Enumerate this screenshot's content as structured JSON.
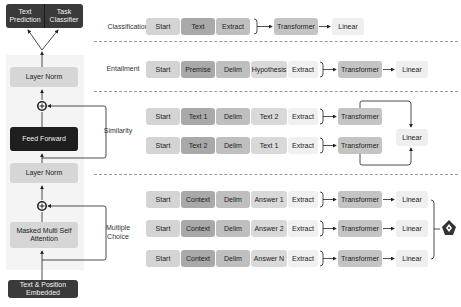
{
  "model": {
    "output_heads": [
      {
        "id": "text-prediction",
        "label": "Text Prediction"
      },
      {
        "id": "task-classifier",
        "label": "Task Classifier"
      }
    ],
    "layer_norm_top": "Layer Norm",
    "feed_forward": "Feed Forward",
    "layer_norm_mid": "Layer Norm",
    "masked_attention": "Masked Multi Self Attention",
    "embedding": "Text & Position Embedded",
    "add_symbol": "+"
  },
  "tasks": {
    "classification": {
      "label": "Classification",
      "row": [
        "Start",
        "Text",
        "Extract"
      ],
      "transformer": "Transformer",
      "linear": "Linear"
    },
    "entailment": {
      "label": "Entailment",
      "row": [
        "Start",
        "Premise",
        "Delim",
        "Hypothesis",
        "Extract"
      ],
      "transformer": "Transformer",
      "linear": "Linear"
    },
    "similarity": {
      "label": "Similarity",
      "rows": [
        [
          "Start",
          "Text 1",
          "Delim",
          "Text 2",
          "Extract"
        ],
        [
          "Start",
          "Text 2",
          "Delim",
          "Text 1",
          "Extract"
        ]
      ],
      "transformer": "Transformer",
      "linear": "Linear"
    },
    "multiple_choice": {
      "label": "Multiple Choice",
      "rows": [
        [
          "Start",
          "Context",
          "Delim",
          "Answer 1",
          "Extract"
        ],
        [
          "Start",
          "Context",
          "Delim",
          "Answer 2",
          "Extract"
        ],
        [
          "Start",
          "Context",
          "Delim",
          "Answer N",
          "Extract"
        ]
      ],
      "transformer": "Transformer",
      "linear": "Linear",
      "output_icon": "softmax-icon"
    }
  }
}
